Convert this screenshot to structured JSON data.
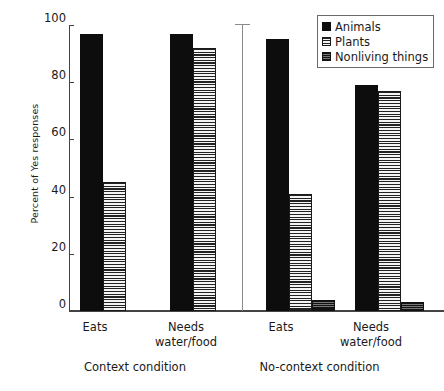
{
  "chart_data": {
    "type": "bar",
    "title": "",
    "xlabel": "",
    "ylabel": "Percent of Yes responses",
    "ylim": [
      0,
      100
    ],
    "yticks": [
      0,
      20,
      40,
      60,
      80,
      100
    ],
    "ytick_labels": [
      "0",
      "20",
      "40",
      "60",
      "80",
      "100"
    ],
    "grid": false,
    "legend_position": "top-right",
    "legend_entries": [
      "Animals",
      "Plants",
      "Nonliving things"
    ],
    "panels": [
      {
        "name": "Context condition",
        "categories": [
          "Eats",
          "Needs\nwater/food"
        ]
      },
      {
        "name": "No-context condition",
        "categories": [
          "Eats",
          "Needs\nwater/food"
        ]
      }
    ],
    "categories": [
      "Eats (Context)",
      "Needs water/food (Context)",
      "Eats (No-context)",
      "Needs water/food (No-context)"
    ],
    "series": [
      {
        "name": "Animals",
        "values": [
          97,
          97,
          95,
          79
        ]
      },
      {
        "name": "Plants",
        "values": [
          45,
          92,
          41,
          77
        ]
      },
      {
        "name": "Nonliving things",
        "values": [
          0,
          0,
          4,
          3
        ]
      }
    ],
    "colors": {
      "animals": "#0d0d0d",
      "plants": "#f2f2f2",
      "nonliving": "#555555",
      "axis": "#444444",
      "divider": "#8a8a8a"
    }
  },
  "axis": {
    "y_label": "Percent of Yes responses",
    "y_ticks": [
      "100",
      "80",
      "60",
      "40",
      "20",
      "0"
    ]
  },
  "groups": [
    {
      "label": "Eats"
    },
    {
      "label": "Needs\nwater/food"
    },
    {
      "label": "Eats"
    },
    {
      "label": "Needs\nwater/food"
    }
  ],
  "conditions": [
    {
      "label": "Context condition"
    },
    {
      "label": "No-context condition"
    }
  ],
  "legend": {
    "items": [
      {
        "label": "Animals",
        "pattern": "solid"
      },
      {
        "label": "Plants",
        "pattern": "horizontal-lines"
      },
      {
        "label": "Nonliving things",
        "pattern": "dense-lines"
      }
    ]
  }
}
